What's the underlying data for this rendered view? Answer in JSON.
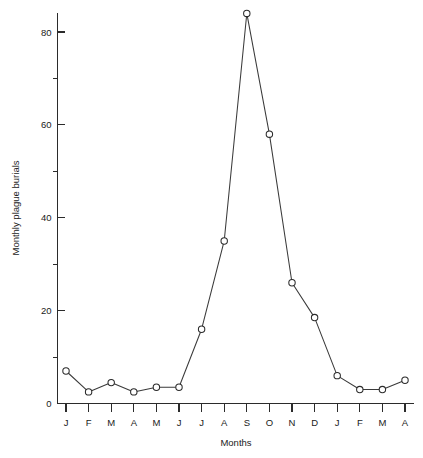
{
  "chart_data": {
    "type": "line",
    "title": "",
    "xlabel": "Months",
    "ylabel": "Monthly plague burials",
    "categories": [
      "J",
      "F",
      "M",
      "A",
      "M",
      "J",
      "J",
      "A",
      "S",
      "O",
      "N",
      "D",
      "J",
      "F",
      "M",
      "A"
    ],
    "values": [
      7,
      2.5,
      4.5,
      2.5,
      3.5,
      3.5,
      16,
      35,
      84,
      58,
      26,
      18.5,
      6,
      3,
      3,
      5
    ],
    "series": [
      {
        "name": "Monthly plague burials",
        "values": [
          7,
          2.5,
          4.5,
          2.5,
          3.5,
          3.5,
          16,
          35,
          84,
          58,
          26,
          18.5,
          6,
          3,
          3,
          5
        ]
      }
    ],
    "ylim": [
      0,
      88
    ],
    "xlim": [
      0,
      17
    ],
    "y_major_ticks": [
      0,
      20,
      40,
      60,
      80
    ],
    "y_major_tick_labels": [
      "0",
      "20",
      "40",
      "60",
      "80"
    ],
    "y_minor_ticks": [
      10,
      30,
      50,
      70,
      88
    ],
    "grid": false,
    "legend": "none",
    "marker": "open-circle",
    "line_color": "#3a3a3a",
    "marker_fill": "#ffffff",
    "marker_stroke": "#2b2b2b",
    "background": "#ffffff"
  }
}
